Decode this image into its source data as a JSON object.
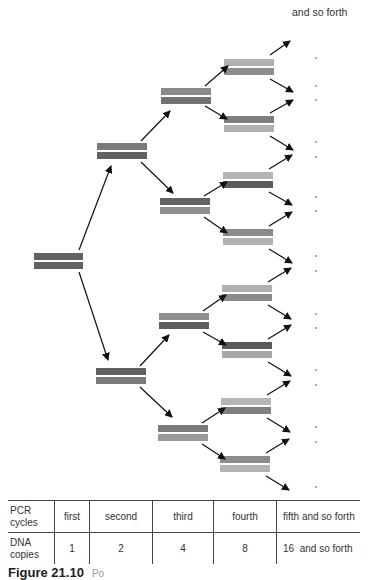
{
  "diagram": {
    "top_label": "and so forth",
    "colors": {
      "dark": "#5e5e5e",
      "medium": "#868686",
      "light": "#b0b0b0",
      "arrow": "#111111",
      "dot": "#aaaaaa"
    }
  },
  "table": {
    "row1": {
      "header": [
        "PCR",
        "cycles"
      ],
      "cells": [
        "first",
        "second",
        "third",
        "fourth",
        "fifth and so forth"
      ]
    },
    "row2": {
      "header": [
        "DNA",
        "copies"
      ],
      "cells": [
        "1",
        "2",
        "4",
        "8",
        "16  and so forth"
      ]
    }
  },
  "caption": {
    "figure_label": "Figure 21.10",
    "text": "Po"
  }
}
